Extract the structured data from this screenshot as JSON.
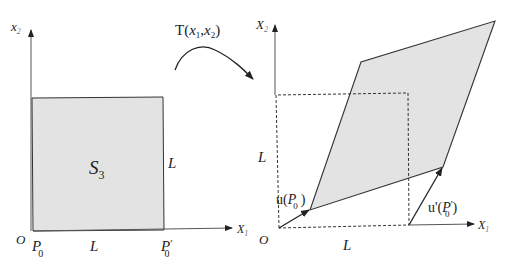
{
  "figure": {
    "colors": {
      "fill": "#e3e3e3",
      "stroke": "#333333",
      "axis": "#555555"
    },
    "left_panel": {
      "axis_y_label": "x",
      "axis_y_sub": "2",
      "axis_x_label": "X",
      "axis_x_sub": "1",
      "origin_label": "O",
      "region_label": "S",
      "region_sub": "3",
      "bottom_left_point": "P",
      "bottom_left_sub": "0",
      "bottom_right_point": "P",
      "bottom_right_sup": "′",
      "bottom_right_sub": "0",
      "side_length_bottom": "L",
      "side_length_right": "L"
    },
    "transform": {
      "label_prefix": "T(",
      "x1": "x",
      "x1_sub": "1",
      "comma": ",",
      "x2": "x",
      "x2_sub": "2",
      "label_suffix": ")"
    },
    "right_panel": {
      "axis_y_label": "X",
      "axis_y_sub": "2",
      "axis_x_label": "X",
      "axis_x_sub": "1",
      "origin_label": "O",
      "side_length_left": "L",
      "side_length_bottom": "L",
      "u_label_prefix": "u(",
      "u_point": "P",
      "u_sub": "0",
      "u_label_suffix": ")",
      "u_prime_label_prefix": "u'(",
      "u_prime_point": "P",
      "u_prime_sup": "′",
      "u_prime_sub": "0",
      "u_prime_label_suffix": ")"
    }
  }
}
